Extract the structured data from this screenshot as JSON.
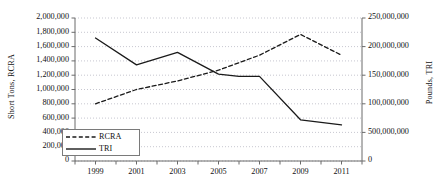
{
  "chart_data": {
    "type": "line",
    "title": "",
    "xlabel": "",
    "ylabel": "Short Tons, RCRA",
    "y2label": "Pounds, TRI",
    "grid": true,
    "legend_position": "bottom-left",
    "x": [
      1999,
      2000,
      2001,
      2002,
      2003,
      2004,
      2005,
      2006,
      2007,
      2008,
      2009,
      2010,
      2011
    ],
    "xlim": [
      1998,
      2012
    ],
    "xticks": [
      1998,
      1999,
      2000,
      2001,
      2002,
      2003,
      2004,
      2005,
      2006,
      2007,
      2008,
      2009,
      2010,
      2011,
      2012
    ],
    "xtick_labels": [
      "1999",
      "2001",
      "2003",
      "2005",
      "2007",
      "2009",
      "2011"
    ],
    "xtick_label_values": [
      1999,
      2001,
      2003,
      2005,
      2007,
      2009,
      2011
    ],
    "ylim": [
      0,
      2000000
    ],
    "yticks": [
      0,
      200000,
      400000,
      600000,
      800000,
      1000000,
      1200000,
      1400000,
      1600000,
      1800000,
      2000000
    ],
    "ytick_labels": [
      "0",
      "200,000",
      "400,000",
      "600,000",
      "800,000",
      "1,000,000",
      "1,200,000",
      "1,400,000",
      "1,600,000",
      "1,800,000",
      "2,000,000"
    ],
    "y2lim": [
      0,
      250000000
    ],
    "y2ticks": [
      0,
      50000000,
      100000000,
      150000000,
      200000000,
      250000000
    ],
    "y2tick_labels": [
      "0",
      "500,000,000",
      "100,000,000",
      "150,000,000",
      "200,000,000",
      "250,000,000"
    ],
    "series": [
      {
        "name": "RCRA",
        "axis": "left",
        "style": "dashed",
        "color": "#1a1a1a",
        "x": [
          1999,
          2001,
          2003,
          2005,
          2007,
          2009,
          2011
        ],
        "values": [
          800000,
          1000000,
          1120000,
          1270000,
          1480000,
          1770000,
          1480000
        ]
      },
      {
        "name": "TRI",
        "axis": "right",
        "style": "solid",
        "color": "#1a1a1a",
        "x": [
          1999,
          2001,
          2003,
          2005,
          2006,
          2007,
          2009,
          2011
        ],
        "values": [
          215000000,
          168000000,
          190000000,
          152000000,
          148000000,
          148000000,
          72000000,
          63000000
        ]
      }
    ],
    "legend": [
      {
        "label": "RCRA",
        "style": "dashed"
      },
      {
        "label": "TRI",
        "style": "solid"
      }
    ]
  }
}
